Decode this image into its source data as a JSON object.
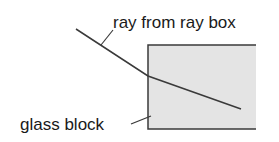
{
  "diagram": {
    "type": "refraction",
    "labels": {
      "ray": "ray from ray box",
      "block": "glass block"
    },
    "colors": {
      "block_fill": "#e4e4e4",
      "line": "#3a3a3a",
      "text": "#1a1a1a"
    }
  }
}
